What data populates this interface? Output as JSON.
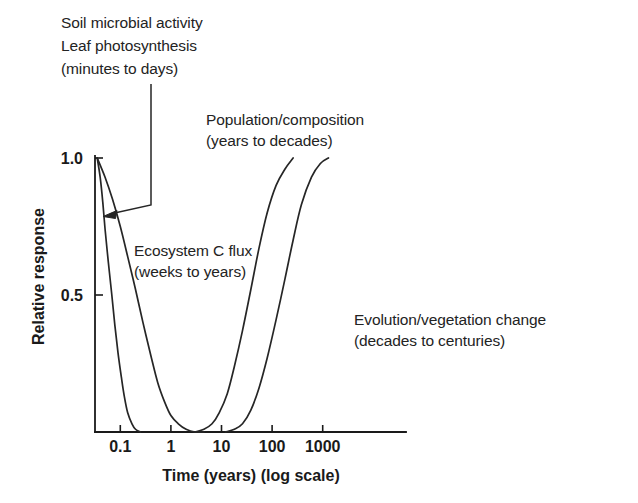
{
  "chart_data": {
    "type": "line",
    "title": "",
    "xlabel": "Time (years) (log scale)",
    "ylabel": "Relative response",
    "x_scale": "log",
    "xlim": [
      0.03,
      5000
    ],
    "ylim": [
      0,
      1.0
    ],
    "grid": false,
    "legend_position": "inline-annotations",
    "x_ticks": [
      {
        "label": "0.1",
        "value": 0.1
      },
      {
        "label": "1",
        "value": 1
      },
      {
        "label": "10",
        "value": 10
      },
      {
        "label": "100",
        "value": 100
      },
      {
        "label": "1000",
        "value": 1000
      }
    ],
    "y_ticks": [
      {
        "label": "0.5",
        "value": 0.5
      },
      {
        "label": "1.0",
        "value": 1.0
      }
    ],
    "series": [
      {
        "name": "Soil microbial activity / Leaf photosynthesis",
        "timescale": "minutes to days",
        "shape": "fast decay from 1.0 to 0",
        "points": [
          [
            0.035,
            1.0
          ],
          [
            0.04,
            0.93
          ],
          [
            0.045,
            0.84
          ],
          [
            0.05,
            0.74
          ],
          [
            0.058,
            0.62
          ],
          [
            0.068,
            0.5
          ],
          [
            0.078,
            0.39
          ],
          [
            0.09,
            0.29
          ],
          [
            0.105,
            0.2
          ],
          [
            0.12,
            0.13
          ],
          [
            0.14,
            0.07
          ],
          [
            0.17,
            0.03
          ],
          [
            0.2,
            0.01
          ],
          [
            0.25,
            0.0
          ]
        ]
      },
      {
        "name": "Ecosystem C flux",
        "timescale": "weeks to years",
        "shape": "slower decay from 1.0 to 0",
        "points": [
          [
            0.035,
            1.0
          ],
          [
            0.05,
            0.93
          ],
          [
            0.07,
            0.85
          ],
          [
            0.1,
            0.75
          ],
          [
            0.14,
            0.64
          ],
          [
            0.2,
            0.52
          ],
          [
            0.28,
            0.4
          ],
          [
            0.4,
            0.28
          ],
          [
            0.55,
            0.18
          ],
          [
            0.75,
            0.11
          ],
          [
            1.0,
            0.06
          ],
          [
            1.4,
            0.03
          ],
          [
            2.0,
            0.01
          ],
          [
            3.0,
            0.0
          ],
          [
            4.5,
            0.0
          ]
        ]
      },
      {
        "name": "Population/composition",
        "timescale": "years to decades",
        "shape": "rise from 0 to 1.0",
        "points": [
          [
            3.0,
            0.0
          ],
          [
            4.5,
            0.01
          ],
          [
            6.5,
            0.03
          ],
          [
            9.0,
            0.07
          ],
          [
            13.0,
            0.14
          ],
          [
            18.0,
            0.24
          ],
          [
            26.0,
            0.37
          ],
          [
            38.0,
            0.52
          ],
          [
            55.0,
            0.67
          ],
          [
            80.0,
            0.8
          ],
          [
            120.0,
            0.9
          ],
          [
            180.0,
            0.96
          ],
          [
            260.0,
            1.0
          ]
        ]
      },
      {
        "name": "Evolution/vegetation change",
        "timescale": "decades to centuries",
        "shape": "rise from 0 to 1.0, lagged",
        "points": [
          [
            12.0,
            0.0
          ],
          [
            18.0,
            0.01
          ],
          [
            26.0,
            0.03
          ],
          [
            38.0,
            0.08
          ],
          [
            55.0,
            0.16
          ],
          [
            80.0,
            0.27
          ],
          [
            120.0,
            0.41
          ],
          [
            180.0,
            0.56
          ],
          [
            260.0,
            0.7
          ],
          [
            380.0,
            0.83
          ],
          [
            600.0,
            0.93
          ],
          [
            900.0,
            0.98
          ],
          [
            1300.0,
            1.0
          ]
        ]
      }
    ],
    "annotations": [
      {
        "id": "soil-leaf",
        "lines": [
          "Soil microbial activity",
          "Leaf photosynthesis",
          "(minutes to days)"
        ],
        "has_leader_line": true
      },
      {
        "id": "population",
        "lines": [
          "Population/composition",
          "(years to decades)"
        ],
        "has_leader_line": false
      },
      {
        "id": "ecosystem",
        "lines": [
          "Ecosystem C flux",
          "(weeks to years)"
        ],
        "has_leader_line": false
      },
      {
        "id": "evolution",
        "lines": [
          "Evolution/vegetation change",
          "(decades to centuries)"
        ],
        "has_leader_line": false
      }
    ],
    "colors": {
      "curve": "#262626",
      "axis": "#1a1a1a",
      "text": "#232323",
      "background": "#ffffff"
    }
  }
}
